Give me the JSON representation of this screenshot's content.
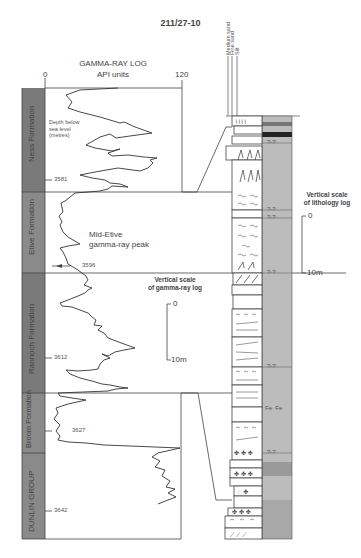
{
  "figure": {
    "title": "211/27-10",
    "gamma_log": {
      "title": "GAMMA-RAY LOG",
      "units": "API units",
      "axis_min": "0",
      "axis_max": "120",
      "depth_note": [
        "Depth below",
        "sea level",
        "(metres)"
      ],
      "annotation": [
        "Mid-Etive",
        "gamma-ray peak"
      ],
      "vertical_scale": {
        "title": [
          "Vertical scale",
          "of gamma-ray log"
        ],
        "top": "0",
        "bottom": "10m"
      }
    },
    "formations": [
      {
        "name": "Ness Formation"
      },
      {
        "name": "Etive Formation"
      },
      {
        "name": "Rannoch Formation"
      },
      {
        "name": "Broom Formation"
      },
      {
        "name": "DUNLIN GROUP"
      }
    ],
    "depth_markers": [
      "3581",
      "3596",
      "3612",
      "3627",
      "3642"
    ],
    "lithology_log": {
      "grain_scale": [
        "Medium sand",
        "Fine sand",
        "Silt"
      ],
      "vertical_scale": {
        "title": [
          "Vertical scale",
          "of lithology log"
        ],
        "top": "0",
        "bottom": "10m"
      },
      "uncertain_marker": "?-?",
      "iron_label": "Fe  Fe"
    },
    "colors": {
      "formation_column": "#7a7a7a",
      "lithology_band": "#bcbcbc",
      "lithology_band_dark": "#9a9a9a",
      "line": "#444444",
      "coal": "#222222"
    }
  }
}
